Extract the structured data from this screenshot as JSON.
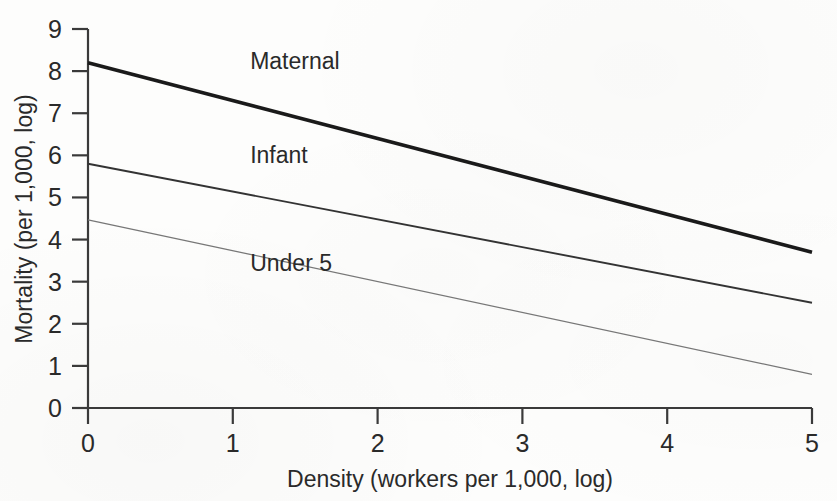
{
  "chart_data": {
    "type": "line",
    "title": "",
    "subtitle": "",
    "xlabel": "Density (workers per 1,000, log)",
    "ylabel": "Mortality (per 1,000, log)",
    "xlim": [
      0,
      5
    ],
    "ylim": [
      0,
      9
    ],
    "xticks": [
      "0",
      "1",
      "2",
      "3",
      "4",
      "5"
    ],
    "yticks": [
      "0",
      "1",
      "2",
      "3",
      "4",
      "5",
      "6",
      "7",
      "8",
      "9"
    ],
    "grid": false,
    "legend_position": "inline-annotation",
    "x": [
      0,
      5
    ],
    "series": [
      {
        "name": "Maternal",
        "values": [
          8.2,
          3.7
        ],
        "color": "#1a1a1a",
        "width": 3.6,
        "label_x": 1.12,
        "label_y": 8.05
      },
      {
        "name": "Infant",
        "values": [
          5.8,
          2.5
        ],
        "color": "#333333",
        "width": 1.9,
        "label_x": 1.12,
        "label_y": 5.82
      },
      {
        "name": "Under 5",
        "values": [
          4.47,
          0.8
        ],
        "color": "#777777",
        "width": 1.3,
        "label_x": 1.12,
        "label_y": 3.25
      }
    ]
  },
  "axes": {
    "x_axis_name": "density-axis",
    "y_axis_name": "mortality-axis"
  }
}
